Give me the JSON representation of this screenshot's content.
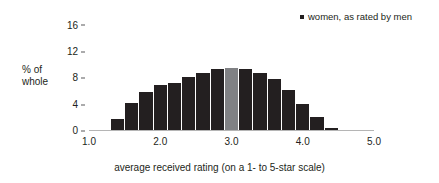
{
  "chart_data": {
    "type": "bar",
    "title": "",
    "subtitle": "",
    "xlabel": "average received rating (on a 1- to 5-star scale)",
    "ylabel": "% of whole",
    "ylabel_lines": [
      "% of",
      "whole"
    ],
    "legend": [
      {
        "label": "women, as rated by men",
        "marker": "square",
        "color": "#231f20"
      }
    ],
    "legend_position": "top-right",
    "grid": false,
    "xlim": [
      1.0,
      5.0
    ],
    "ylim": [
      0,
      17
    ],
    "xticks": [
      "1.0",
      "2.0",
      "3.0",
      "4.0",
      "5.0"
    ],
    "xtick_values": [
      1.0,
      2.0,
      3.0,
      4.0,
      5.0
    ],
    "yticks": [
      "0",
      "4",
      "8",
      "12",
      "16"
    ],
    "ytick_values": [
      0,
      4,
      8,
      12,
      16
    ],
    "bar_color": "#231f20",
    "highlight_color": "#808184",
    "highlight_x": 3.0,
    "bin_width": 0.2,
    "x": [
      1.4,
      1.6,
      1.8,
      2.0,
      2.2,
      2.4,
      2.6,
      2.8,
      3.0,
      3.2,
      3.4,
      3.6,
      3.8,
      4.0,
      4.2,
      4.4
    ],
    "values": [
      1.7,
      4.1,
      5.8,
      6.8,
      7.2,
      8.0,
      8.7,
      9.2,
      9.4,
      9.2,
      8.7,
      7.7,
      6.0,
      4.0,
      1.9,
      0.3
    ],
    "categories": [
      "1.4",
      "1.6",
      "1.8",
      "2.0",
      "2.2",
      "2.4",
      "2.6",
      "2.8",
      "3.0",
      "3.2",
      "3.4",
      "3.6",
      "3.8",
      "4.0",
      "4.2",
      "4.4"
    ]
  }
}
